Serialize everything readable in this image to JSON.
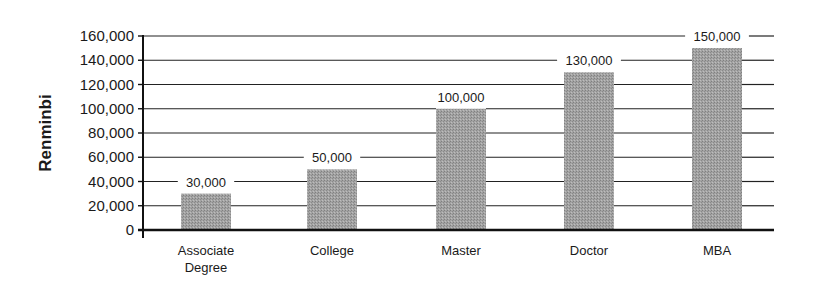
{
  "chart_data": {
    "type": "bar",
    "title": "",
    "xlabel": "",
    "ylabel": "Renminbi",
    "ylim": [
      0,
      160000
    ],
    "yticks": [
      0,
      20000,
      40000,
      60000,
      80000,
      100000,
      120000,
      140000,
      160000
    ],
    "ytick_labels": [
      "0",
      "20,000",
      "40,000",
      "60,000",
      "80,000",
      "100,000",
      "120,000",
      "140,000",
      "160,000"
    ],
    "categories": [
      "Associate Degree",
      "College",
      "Master",
      "Doctor",
      "MBA"
    ],
    "category_lines": [
      [
        "Associate",
        "Degree"
      ],
      [
        "College"
      ],
      [
        "Master"
      ],
      [
        "Doctor"
      ],
      [
        "MBA"
      ]
    ],
    "values": [
      30000,
      50000,
      100000,
      130000,
      150000
    ],
    "value_labels": [
      "30,000",
      "50,000",
      "100,000",
      "130,000",
      "150,000"
    ],
    "grid": true,
    "legend": null,
    "colors": {
      "bar": "#9a9a9a",
      "grid": "#222222",
      "axis": "#111111"
    }
  }
}
